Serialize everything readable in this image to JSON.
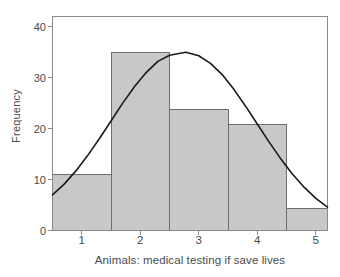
{
  "chart_data": {
    "type": "bar",
    "title": "",
    "subtitle": "",
    "xlabel": "Animals: medical testing if save lives",
    "ylabel": "Frequency",
    "categories": [
      "1",
      "2",
      "3",
      "4",
      "5"
    ],
    "values": [
      11,
      35,
      23.7,
      20.9,
      4.4
    ],
    "bin_edges": [
      0.5,
      1.5,
      2.5,
      3.5,
      4.5,
      5.2
    ],
    "xlim": [
      0.5,
      5.2
    ],
    "ylim": [
      0,
      42
    ],
    "xticks": [
      "1",
      "2",
      "3",
      "4",
      "5"
    ],
    "yticks": [
      "0",
      "10",
      "20",
      "30",
      "40"
    ],
    "grid": false,
    "legend": null,
    "overlay": {
      "type": "line",
      "name": "normal curve",
      "mean": 2.78,
      "sigma": 1.0,
      "peak_value": 35,
      "points": [
        [
          0.5,
          7.0
        ],
        [
          0.7,
          9.1
        ],
        [
          0.9,
          11.7
        ],
        [
          1.1,
          14.7
        ],
        [
          1.3,
          18.0
        ],
        [
          1.5,
          21.5
        ],
        [
          1.7,
          25.0
        ],
        [
          1.9,
          28.2
        ],
        [
          2.1,
          31.0
        ],
        [
          2.3,
          33.2
        ],
        [
          2.5,
          34.4
        ],
        [
          2.78,
          35.0
        ],
        [
          3.0,
          34.3
        ],
        [
          3.2,
          32.8
        ],
        [
          3.4,
          30.6
        ],
        [
          3.6,
          27.7
        ],
        [
          3.8,
          24.4
        ],
        [
          4.0,
          20.9
        ],
        [
          4.2,
          17.4
        ],
        [
          4.4,
          14.1
        ],
        [
          4.6,
          11.1
        ],
        [
          4.8,
          8.5
        ],
        [
          5.0,
          6.3
        ],
        [
          5.2,
          4.6
        ]
      ]
    },
    "colors": {
      "bar_fill": "#c8c8c8",
      "bar_edge": "#6e6e6e",
      "curve": "#1a1a1a",
      "axis": "#8a8a8a",
      "text": "#4a4a4a",
      "background": "#ffffff"
    }
  }
}
